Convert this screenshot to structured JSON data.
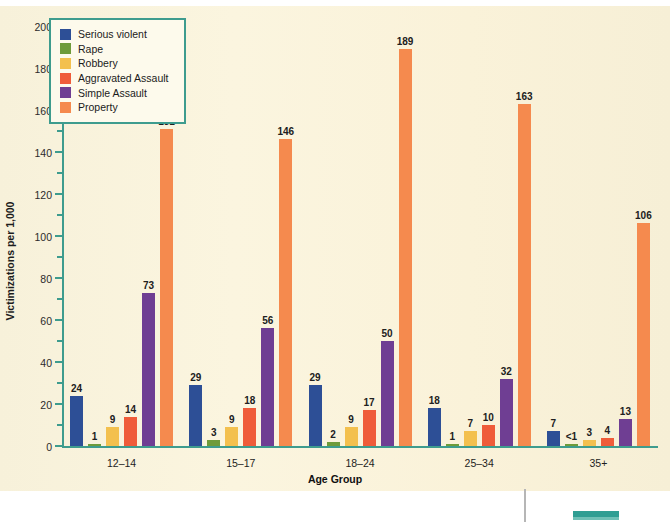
{
  "chart_data": {
    "type": "bar",
    "title": "",
    "xlabel": "Age Group",
    "ylabel": "Victimizations per 1,000",
    "ylim": [
      0,
      200
    ],
    "ytick_step": 20,
    "yminor_step": 10,
    "grid": false,
    "legend_position": "top-left",
    "categories": [
      "12–14",
      "15–17",
      "18–24",
      "25–34",
      "35+"
    ],
    "yticks": [
      "0",
      "20",
      "40",
      "60",
      "80",
      "100",
      "120",
      "140",
      "160",
      "180",
      "200"
    ],
    "series": [
      {
        "name": "Serious violent",
        "color": "#2d4f96",
        "values": [
          24,
          29,
          29,
          18,
          7
        ],
        "labels": [
          "24",
          "29",
          "29",
          "18",
          "7"
        ]
      },
      {
        "name": "Rape",
        "color": "#6e9b3a",
        "values": [
          1,
          3,
          2,
          1,
          0.5
        ],
        "labels": [
          "1",
          "3",
          "2",
          "1",
          "<1"
        ]
      },
      {
        "name": "Robbery",
        "color": "#f3c04e",
        "values": [
          9,
          9,
          9,
          7,
          3
        ],
        "labels": [
          "9",
          "9",
          "9",
          "7",
          "3"
        ]
      },
      {
        "name": "Aggravated Assault",
        "color": "#ef5c3a",
        "values": [
          14,
          18,
          17,
          10,
          4
        ],
        "labels": [
          "14",
          "18",
          "17",
          "10",
          "4"
        ]
      },
      {
        "name": "Simple Assault",
        "color": "#6f3e93",
        "values": [
          73,
          56,
          50,
          32,
          13
        ],
        "labels": [
          "73",
          "56",
          "50",
          "32",
          "13"
        ]
      },
      {
        "name": "Property",
        "color": "#f58a4e",
        "values": [
          151,
          146,
          189,
          163,
          106
        ],
        "labels": [
          "151",
          "146",
          "189",
          "163",
          "106"
        ]
      }
    ]
  },
  "colors": {
    "background": "#faf3dc",
    "axis": "#3e9c8e",
    "legend_border": "#3e9c8e",
    "text": "#1b1b1b"
  }
}
